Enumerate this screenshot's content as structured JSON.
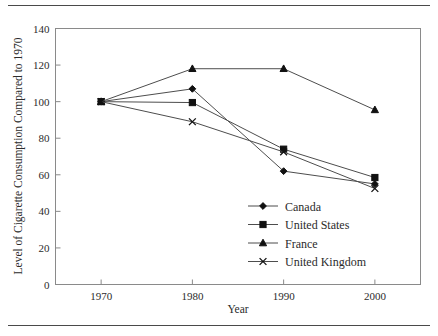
{
  "chart_data": {
    "type": "line",
    "title": "",
    "xlabel": "Year",
    "ylabel": "Level of Cigarette Consumption Compared to 1970",
    "x": [
      1970,
      1980,
      1990,
      2000
    ],
    "categories": [
      "1970",
      "1980",
      "1990",
      "2000"
    ],
    "xlim": [
      1965,
      2005
    ],
    "ylim": [
      0,
      140
    ],
    "ytick_labels": [
      "0",
      "20",
      "40",
      "60",
      "80",
      "100",
      "120",
      "140"
    ],
    "ytick_values": [
      0,
      20,
      40,
      60,
      80,
      100,
      120,
      140
    ],
    "xtick_labels": [
      "1970",
      "1980",
      "1990",
      "2000"
    ],
    "grid": false,
    "legend_position": "center-right-inside",
    "series": [
      {
        "name": "Canada",
        "marker": "diamond",
        "values": [
          100,
          107,
          62,
          55
        ]
      },
      {
        "name": "United States",
        "marker": "square",
        "values": [
          100,
          99.5,
          74,
          58.5
        ]
      },
      {
        "name": "France",
        "marker": "triangle",
        "values": [
          100,
          118,
          118,
          95.5
        ]
      },
      {
        "name": "United Kingdom",
        "marker": "cross",
        "values": [
          100,
          89,
          72.5,
          52.5
        ]
      }
    ]
  },
  "colors": {
    "line": "#4d4d4d",
    "marker": "#111111",
    "frame": "#8a8a8a",
    "text": "#2b2b2b",
    "rule": "#4a4a4a",
    "background": "#ffffff"
  }
}
